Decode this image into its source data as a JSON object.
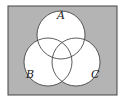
{
  "diagram": {
    "type": "venn-3",
    "colors": {
      "universe_fill": "#b4b4b4",
      "set_fill": "#ffffff",
      "stroke": "#333333"
    },
    "sets": [
      {
        "label": "A"
      },
      {
        "label": "B"
      },
      {
        "label": "C"
      }
    ],
    "shaded_region": "complement of A ∪ B ∪ C"
  }
}
